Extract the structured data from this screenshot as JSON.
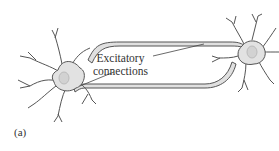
{
  "diagram": {
    "label_line1": "Excitatory",
    "label_line2": "connections",
    "panel_label": "(a)",
    "nodes": [
      {
        "name": "left-neuron"
      },
      {
        "name": "right-neuron"
      }
    ],
    "edges": [
      {
        "from": "left-neuron",
        "to": "right-neuron",
        "type": "excitatory"
      },
      {
        "from": "right-neuron",
        "to": "left-neuron",
        "type": "excitatory"
      }
    ],
    "colors": {
      "soma": "#e2e2e2",
      "outline": "#555555",
      "axon": "#d8d8d8"
    }
  }
}
